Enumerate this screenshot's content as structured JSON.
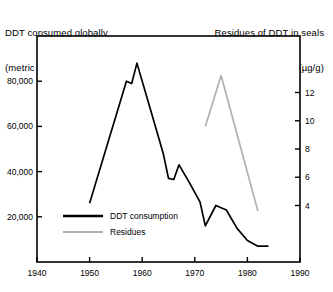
{
  "titles": {
    "left_line1": "DDT consumed globally",
    "left_line2": "(metric tons)",
    "right_line1": "Residues of DDT in seals",
    "right_line2": "(µg/g)"
  },
  "colors": {
    "consumption": "#000000",
    "residues": "#b0b0b0",
    "frame": "#000000",
    "background": "#ffffff"
  },
  "chart_data": {
    "type": "line",
    "xlabel": "",
    "ylabel": "DDT consumed globally (metric tons)",
    "y2label": "Residues of DDT in seals (µg/g)",
    "grid": false,
    "legend_position": "inside-lower-left",
    "xlim": [
      1940,
      1990
    ],
    "xticks": [
      1940,
      1950,
      1960,
      1970,
      1980,
      1990
    ],
    "xticklabels": [
      "1940",
      "1950",
      "1960",
      "1970",
      "1980",
      "1990"
    ],
    "ylim": [
      0,
      100000
    ],
    "yticks": [
      20000,
      40000,
      60000,
      80000
    ],
    "yticklabels": [
      "20,000",
      "40,000",
      "60,000",
      "80,000"
    ],
    "y2lim": [
      0,
      16
    ],
    "y2ticks": [
      4,
      6,
      8,
      10,
      12
    ],
    "y2ticklabels": [
      "4",
      "6",
      "8",
      "10",
      "12"
    ],
    "series": [
      {
        "name": "DDT consumption",
        "axis": "left",
        "color": "#000000",
        "x": [
          1950,
          1957,
          1958,
          1959,
          1962,
          1964,
          1965,
          1966,
          1967,
          1969,
          1971,
          1972,
          1974,
          1976,
          1978,
          1980,
          1982,
          1984
        ],
        "y": [
          26000,
          80000,
          79000,
          88000,
          64000,
          48000,
          37000,
          36500,
          43000,
          35000,
          26500,
          16000,
          25000,
          23000,
          15000,
          9500,
          7000,
          7000
        ]
      },
      {
        "name": "Residues",
        "axis": "right",
        "color": "#b0b0b0",
        "x": [
          1972,
          1975,
          1982
        ],
        "y": [
          9.6,
          13.2,
          3.6
        ]
      }
    ]
  },
  "legend": {
    "items": [
      {
        "label": "DDT consumption",
        "color": "#000000",
        "style": "solid-thick"
      },
      {
        "label": "Residues",
        "color": "#b0b0b0",
        "style": "solid-thin"
      }
    ]
  }
}
